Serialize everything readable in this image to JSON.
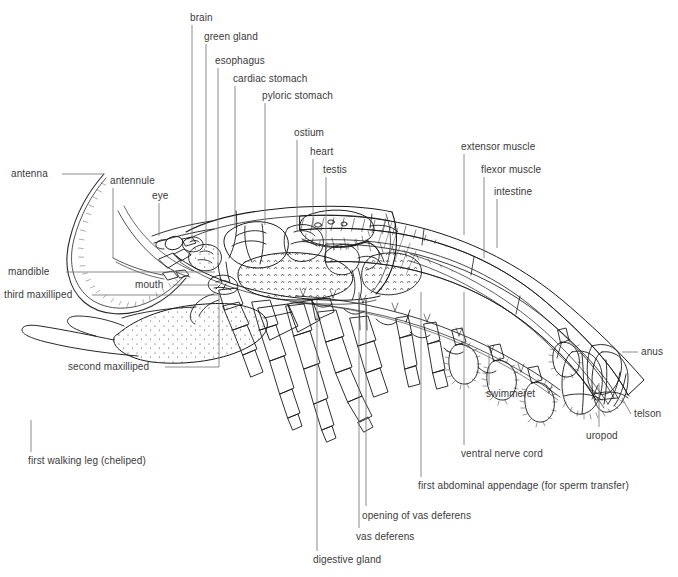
{
  "figure": {
    "organism": "male lobster",
    "ink_color": "#1a1a1a",
    "label_color": "#3a3a3a",
    "leader_color": "#6e6e6e",
    "background_color": "#ffffff"
  },
  "labels": [
    {
      "id": "antenna",
      "text": "antenna",
      "x": 11,
      "y": 168,
      "align": "left",
      "leader": {
        "type": "h",
        "x1": 62,
        "y1": 174,
        "x2": 104,
        "y2": 174
      }
    },
    {
      "id": "antennule",
      "text": "antennule",
      "x": 110,
      "y": 175,
      "align": "left",
      "leader": {
        "type": "v",
        "x1": 113,
        "y1": 188,
        "x2": 113,
        "y2": 258
      }
    },
    {
      "id": "eye",
      "text": "eye",
      "x": 152,
      "y": 190,
      "align": "left",
      "leader": {
        "type": "v",
        "x1": 159,
        "y1": 203,
        "x2": 159,
        "y2": 236
      }
    },
    {
      "id": "brain",
      "text": "brain",
      "x": 190,
      "y": 12,
      "align": "left",
      "leader": {
        "type": "v",
        "x1": 192,
        "y1": 25,
        "x2": 192,
        "y2": 242
      }
    },
    {
      "id": "green-gland",
      "text": "green gland",
      "x": 204,
      "y": 31,
      "align": "left",
      "leader": {
        "type": "v",
        "x1": 206,
        "y1": 44,
        "x2": 206,
        "y2": 248
      }
    },
    {
      "id": "esophagus",
      "text": "esophagus",
      "x": 215,
      "y": 55,
      "align": "left",
      "leader": {
        "type": "v",
        "x1": 218,
        "y1": 68,
        "x2": 218,
        "y2": 264
      }
    },
    {
      "id": "cardiac-stomach",
      "text": "cardiac stomach",
      "x": 233,
      "y": 73,
      "align": "left",
      "leader": {
        "type": "v",
        "x1": 235,
        "y1": 86,
        "x2": 235,
        "y2": 228
      }
    },
    {
      "id": "pyloric-stomach",
      "text": "pyloric stomach",
      "x": 262,
      "y": 90,
      "align": "left",
      "leader": {
        "type": "v",
        "x1": 265,
        "y1": 103,
        "x2": 265,
        "y2": 225
      }
    },
    {
      "id": "ostium",
      "text": "ostium",
      "x": 294,
      "y": 127,
      "align": "left",
      "leader": {
        "type": "v",
        "x1": 297,
        "y1": 140,
        "x2": 297,
        "y2": 232
      }
    },
    {
      "id": "heart",
      "text": "heart",
      "x": 310,
      "y": 146,
      "align": "left",
      "leader": {
        "type": "v",
        "x1": 313,
        "y1": 159,
        "x2": 313,
        "y2": 228
      }
    },
    {
      "id": "testis",
      "text": "testis",
      "x": 323,
      "y": 164,
      "align": "left",
      "leader": {
        "type": "v",
        "x1": 326,
        "y1": 177,
        "x2": 326,
        "y2": 252
      }
    },
    {
      "id": "extensor-muscle",
      "text": "extensor muscle",
      "x": 461,
      "y": 141,
      "align": "left",
      "leader": {
        "type": "v",
        "x1": 464,
        "y1": 154,
        "x2": 464,
        "y2": 235
      }
    },
    {
      "id": "flexor-muscle",
      "text": "flexor muscle",
      "x": 481,
      "y": 164,
      "align": "left",
      "leader": {
        "type": "v",
        "x1": 484,
        "y1": 177,
        "x2": 484,
        "y2": 258
      }
    },
    {
      "id": "intestine",
      "text": "intestine",
      "x": 494,
      "y": 186,
      "align": "left",
      "leader": {
        "type": "v",
        "x1": 497,
        "y1": 199,
        "x2": 497,
        "y2": 248
      }
    },
    {
      "id": "mandible",
      "text": "mandible",
      "x": 8,
      "y": 266,
      "align": "left",
      "leader": {
        "type": "h",
        "x1": 66,
        "y1": 272,
        "x2": 215,
        "y2": 272
      }
    },
    {
      "id": "mouth",
      "text": "mouth",
      "x": 135,
      "y": 279,
      "align": "left",
      "leader": {
        "type": "h",
        "x1": 173,
        "y1": 285,
        "x2": 218,
        "y2": 285
      }
    },
    {
      "id": "third-maxilliped",
      "text": "third maxilliped",
      "x": 4,
      "y": 289,
      "align": "left",
      "leader": {
        "type": "h",
        "x1": 92,
        "y1": 295,
        "x2": 219,
        "y2": 295
      }
    },
    {
      "id": "second-maxilliped",
      "text": "second maxilliped",
      "x": 68,
      "y": 361,
      "align": "left",
      "leader": {
        "type": "l",
        "x1": 165,
        "y1": 367,
        "x2": 219,
        "y2": 367,
        "vx": 219,
        "vy1": 367,
        "vy2": 290
      }
    },
    {
      "id": "first-walking-leg",
      "text": "first walking leg (cheliped)",
      "x": 28,
      "y": 455,
      "align": "left",
      "leader": {
        "type": "v",
        "x1": 31,
        "y1": 420,
        "x2": 31,
        "y2": 452
      }
    },
    {
      "id": "digestive-gland",
      "text": "digestive gland",
      "x": 313,
      "y": 554,
      "align": "left",
      "leader": {
        "type": "v",
        "x1": 317,
        "y1": 300,
        "x2": 317,
        "y2": 551
      }
    },
    {
      "id": "vas-deferens",
      "text": "vas deferens",
      "x": 356,
      "y": 531,
      "align": "left",
      "leader": {
        "type": "v",
        "x1": 359,
        "y1": 292,
        "x2": 359,
        "y2": 528
      }
    },
    {
      "id": "opening-vas-deferens",
      "text": "opening of vas deferens",
      "x": 362,
      "y": 510,
      "align": "left",
      "leader": {
        "type": "v",
        "x1": 366,
        "y1": 300,
        "x2": 366,
        "y2": 506
      }
    },
    {
      "id": "first-abdominal-appendage",
      "text": "first abdominal appendage (for sperm transfer)",
      "x": 418,
      "y": 480,
      "align": "left",
      "leader": {
        "type": "v",
        "x1": 421,
        "y1": 292,
        "x2": 421,
        "y2": 477
      }
    },
    {
      "id": "ventral-nerve-cord",
      "text": "ventral nerve cord",
      "x": 461,
      "y": 448,
      "align": "left",
      "leader": {
        "type": "v",
        "x1": 464,
        "y1": 292,
        "x2": 464,
        "y2": 445
      }
    },
    {
      "id": "swimmeret",
      "text": "swimmeret",
      "x": 486,
      "y": 388,
      "align": "left",
      "leader": {
        "type": "v",
        "x1": 489,
        "y1": 355,
        "x2": 489,
        "y2": 385
      }
    },
    {
      "id": "anus",
      "text": "anus",
      "x": 641,
      "y": 346,
      "align": "left",
      "leader": {
        "type": "h",
        "x1": 622,
        "y1": 352,
        "x2": 638,
        "y2": 352
      }
    },
    {
      "id": "telson",
      "text": "telson",
      "x": 634,
      "y": 408,
      "align": "left",
      "leader": {
        "type": "h",
        "x1": 622,
        "y1": 398,
        "x2": 631,
        "y2": 414
      }
    },
    {
      "id": "uropod",
      "text": "uropod",
      "x": 586,
      "y": 430,
      "align": "left",
      "leader": {
        "type": "v",
        "x1": 599,
        "y1": 383,
        "x2": 599,
        "y2": 427
      }
    }
  ]
}
